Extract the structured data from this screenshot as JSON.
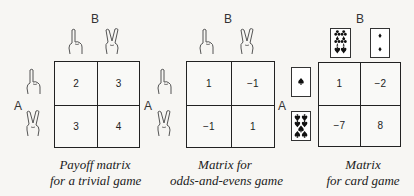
{
  "matrices": [
    {
      "player_top": "B",
      "player_left": "A",
      "col_strategies": [
        "one-finger-icon",
        "two-fingers-icon"
      ],
      "row_strategies": [
        "one-finger-icon",
        "two-fingers-icon"
      ],
      "cells": [
        [
          "2",
          "3"
        ],
        [
          "3",
          "4"
        ]
      ],
      "caption_line1": "Payoff matrix",
      "caption_line2": "for a trivial game"
    },
    {
      "player_top": "B",
      "player_left": "A",
      "col_strategies": [
        "one-finger-icon",
        "two-fingers-icon"
      ],
      "row_strategies": [
        "one-finger-icon",
        "two-fingers-icon"
      ],
      "cells": [
        [
          "1",
          "−1"
        ],
        [
          "−1",
          "1"
        ]
      ],
      "caption_line1": "Matrix for",
      "caption_line2": "odds-and-evens game"
    },
    {
      "player_top": "B",
      "player_left": "A",
      "col_strategies": [
        "six-of-clubs-card-icon",
        "two-of-diamonds-card-icon"
      ],
      "row_strategies": [
        "ace-of-spades-card-icon",
        "seven-of-spades-card-icon"
      ],
      "cells": [
        [
          "1",
          "−2"
        ],
        [
          "−7",
          "8"
        ]
      ],
      "caption_line1": "Matrix",
      "caption_line2": "for card game"
    }
  ]
}
